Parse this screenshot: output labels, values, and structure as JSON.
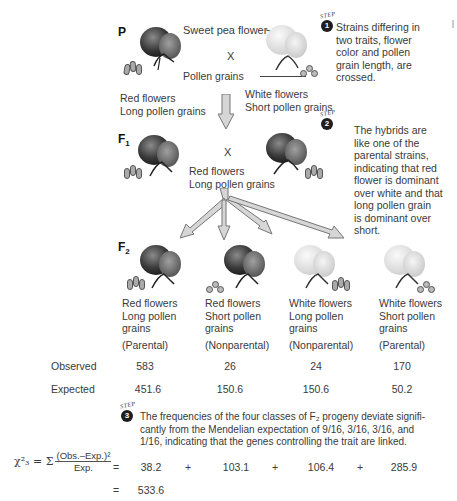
{
  "generations": {
    "p": {
      "label": "P"
    },
    "f1": {
      "label": "F",
      "sub": "1"
    },
    "f2": {
      "label": "F",
      "sub": "2"
    }
  },
  "parental": {
    "left": {
      "line1": "Red flowers",
      "line2": "Long pollen grains",
      "flower_color": "red",
      "pollen": "long"
    },
    "right": {
      "line1": "White flowers",
      "line2": "Short pollen grains",
      "flower_color": "white",
      "pollen": "short"
    },
    "cross_symbol": "X",
    "callout_flower": "Sweet pea flower",
    "callout_pollen": "Pollen grains"
  },
  "f1": {
    "cross_symbol": "X",
    "line1": "Red flowers",
    "line2": "Long pollen grains"
  },
  "f2_classes": [
    {
      "line1": "Red flowers",
      "line2": "Long pollen",
      "line3": "grains",
      "type": "(Parental)",
      "flower_color": "red",
      "pollen": "long"
    },
    {
      "line1": "Red flowers",
      "line2": "Short pollen",
      "line3": "grains",
      "type": "(Nonparental)",
      "flower_color": "red",
      "pollen": "short"
    },
    {
      "line1": "White flowers",
      "line2": "Long pollen",
      "line3": "grains",
      "type": "(Nonparental)",
      "flower_color": "white",
      "pollen": "long"
    },
    {
      "line1": "White flowers",
      "line2": "Short pollen",
      "line3": "grains",
      "type": "(Parental)",
      "flower_color": "white",
      "pollen": "short"
    }
  ],
  "table": {
    "observed_label": "Observed",
    "expected_label": "Expected",
    "observed": [
      "583",
      "26",
      "24",
      "170"
    ],
    "expected": [
      "451.6",
      "150.6",
      "150.6",
      "50.2"
    ]
  },
  "steps": [
    {
      "word": "STEP",
      "number": "1",
      "text": [
        "Strains differing in",
        "two traits, flower",
        "color and pollen",
        "grain length, are",
        "crossed."
      ]
    },
    {
      "word": "STEP",
      "number": "2",
      "text": [
        "The hybrids are",
        "like one of the",
        "parental strains,",
        "indicating that red",
        "flower is dominant",
        "over white and that",
        "long pollen grain",
        "is dominant over",
        "short."
      ]
    },
    {
      "word": "STEP",
      "number": "3",
      "text": [
        "The frequencies of the four classes of F₂ progeny deviate signifi-",
        "cantly from the Mendelian expectation of  9/16, 3/16, 3/16, and",
        "1/16, indicating that the genes controlling the trait are linked."
      ]
    }
  ],
  "chi_square": {
    "lhs": "χ²₃ = Σ",
    "numerator": "(Obs.–Exp.)²",
    "denominator": "Exp.",
    "eq1": "=",
    "terms": [
      "38.2",
      "103.1",
      "106.4",
      "285.9"
    ],
    "plus": "+",
    "eq2": "=",
    "total": "533.6"
  },
  "colors": {
    "red_flower_dark": "#2a2a2a",
    "red_flower_mid": "#6a6a6a",
    "white_flower": "#e2e2e2",
    "arrow_fill": "#d6d6d6",
    "arrow_stroke": "#777777",
    "step_badge": "#1e1e1e"
  }
}
